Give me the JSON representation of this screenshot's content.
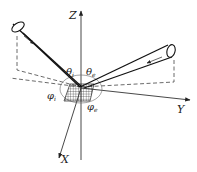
{
  "diagram": {
    "type": "brdf-geometry",
    "axes": {
      "z_label": "Z",
      "y_label": "Y",
      "x_label": "X"
    },
    "angles": {
      "theta_incident": {
        "symbol": "θ",
        "subscript": "i"
      },
      "theta_emergent": {
        "symbol": "θ",
        "subscript": "e"
      },
      "phi_incident": {
        "symbol": "φ",
        "subscript": "i"
      },
      "phi_emergent": {
        "symbol": "φ",
        "subscript": "e"
      }
    },
    "beams": [
      {
        "name": "incident-beam",
        "direction": "toward-origin"
      },
      {
        "name": "reflected-beam",
        "direction": "away-from-origin"
      }
    ],
    "colors": {
      "line": "#222222",
      "background": "#ffffff"
    }
  }
}
